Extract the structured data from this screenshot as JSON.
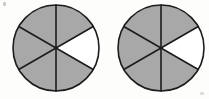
{
  "figure": {
    "background_color": "#fdfdfc",
    "shaded_color": "#a8a8a8",
    "unshaded_color": "#ffffff",
    "line_color": "#1c1c1c",
    "outline_width": 1.6,
    "divider_width": 1.6
  },
  "chart_data": {
    "type": "pie",
    "title": "",
    "xlabel": "",
    "ylabel": "",
    "legend": [],
    "models": [
      {
        "name": "circle-left",
        "center_x": 56,
        "center_y": 48,
        "radius": 43,
        "total_sectors": 6,
        "shaded_sectors": 5,
        "unshaded_sectors": 1,
        "sector_angle_degrees": 60,
        "fraction": "5/6",
        "value": 0.8333,
        "start_angle_degrees": -30,
        "sectors": [
          {
            "index": 0,
            "start": -30,
            "end": 30,
            "shaded": false
          },
          {
            "index": 1,
            "start": 30,
            "end": 90,
            "shaded": true
          },
          {
            "index": 2,
            "start": 90,
            "end": 150,
            "shaded": true
          },
          {
            "index": 3,
            "start": 150,
            "end": 210,
            "shaded": true
          },
          {
            "index": 4,
            "start": 210,
            "end": 270,
            "shaded": true
          },
          {
            "index": 5,
            "start": 270,
            "end": 330,
            "shaded": true
          }
        ]
      },
      {
        "name": "circle-right",
        "center_x": 161,
        "center_y": 48,
        "radius": 43,
        "total_sectors": 6,
        "shaded_sectors": 5,
        "unshaded_sectors": 1,
        "sector_angle_degrees": 60,
        "fraction": "5/6",
        "value": 0.8333,
        "start_angle_degrees": -30,
        "sectors": [
          {
            "index": 0,
            "start": -30,
            "end": 30,
            "shaded": false
          },
          {
            "index": 1,
            "start": 30,
            "end": 90,
            "shaded": true
          },
          {
            "index": 2,
            "start": 90,
            "end": 150,
            "shaded": true
          },
          {
            "index": 3,
            "start": 150,
            "end": 210,
            "shaded": true
          },
          {
            "index": 4,
            "start": 210,
            "end": 270,
            "shaded": true
          },
          {
            "index": 5,
            "start": 270,
            "end": 330,
            "shaded": true
          }
        ]
      }
    ]
  }
}
